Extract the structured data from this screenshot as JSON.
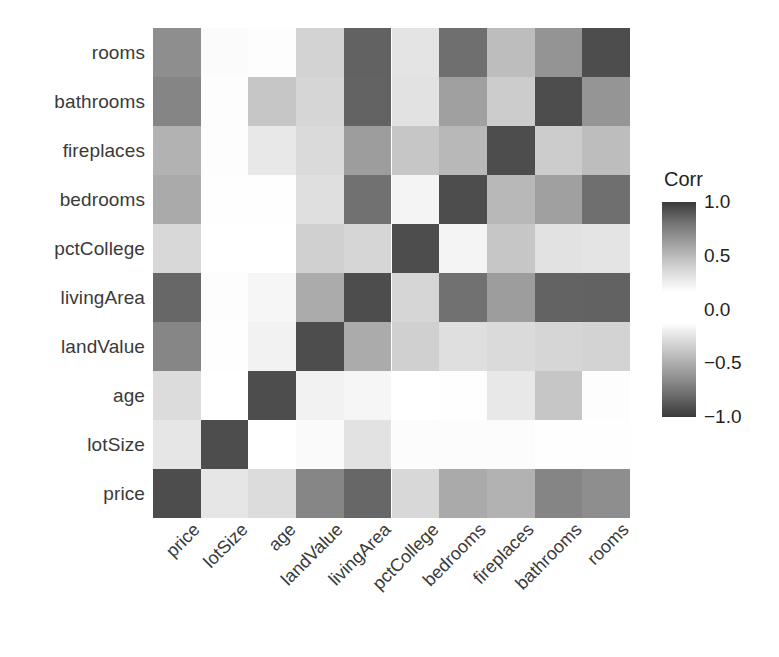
{
  "figure": {
    "type": "correlation-heatmap",
    "background": "#ffffff"
  },
  "legend": {
    "title": "Corr",
    "ticks": [
      {
        "label": "1.0",
        "value": 1.0
      },
      {
        "label": "0.5",
        "value": 0.5
      },
      {
        "label": "0.0",
        "value": 0.0
      },
      {
        "label": "−0.5",
        "value": -0.5
      },
      {
        "label": "−1.0",
        "value": -1.0
      }
    ],
    "high_color": "#3a3a3a",
    "mid_color": "#ffffff",
    "low_color": "#3a3a3a"
  },
  "chart_data": {
    "type": "heatmap",
    "title": "",
    "xlabel": "",
    "ylabel": "",
    "grid": false,
    "legend_position": "right",
    "legend_title": "Corr",
    "zlim": [
      -1.0,
      1.0
    ],
    "x": [
      "price",
      "lotSize",
      "age",
      "landValue",
      "livingArea",
      "pctCollege",
      "bedrooms",
      "fireplaces",
      "bathrooms",
      "rooms"
    ],
    "y": [
      "rooms",
      "bathrooms",
      "fireplaces",
      "bedrooms",
      "pctCollege",
      "livingArea",
      "landValue",
      "age",
      "lotSize",
      "price"
    ],
    "xtick_labels": [
      "price",
      "lotSize",
      "age",
      "landValue",
      "livingArea",
      "pctCollege",
      "bedrooms",
      "fireplaces",
      "bathrooms",
      "rooms"
    ],
    "ytick_labels": [
      "rooms",
      "bathrooms",
      "fireplaces",
      "bedrooms",
      "pctCollege",
      "livingArea",
      "landValue",
      "age",
      "lotSize",
      "price"
    ],
    "values": [
      [
        0.53,
        0.0,
        0.01,
        0.23,
        0.73,
        0.16,
        0.67,
        0.32,
        0.52,
        1.0
      ],
      [
        0.59,
        0.0,
        0.19,
        0.22,
        0.72,
        0.17,
        0.46,
        0.24,
        1.0,
        0.52
      ],
      [
        0.38,
        0.0,
        0.11,
        0.21,
        0.47,
        0.25,
        0.29,
        1.0,
        0.24,
        0.32
      ],
      [
        0.42,
        0.0,
        0.0,
        0.19,
        0.66,
        0.04,
        1.0,
        0.29,
        0.46,
        0.67
      ],
      [
        0.2,
        0.0,
        0.0,
        0.24,
        0.21,
        1.0,
        0.04,
        0.25,
        0.17,
        0.16
      ],
      [
        0.71,
        0.0,
        0.03,
        0.42,
        1.0,
        0.21,
        0.66,
        0.47,
        0.72,
        0.73
      ],
      [
        0.58,
        0.0,
        0.05,
        1.0,
        0.42,
        0.24,
        0.19,
        0.21,
        0.22,
        0.23
      ],
      [
        0.19,
        0.0,
        1.0,
        0.05,
        0.03,
        0.0,
        0.0,
        0.11,
        0.19,
        0.01
      ],
      [
        0.16,
        1.0,
        0.0,
        0.05,
        0.17,
        0.15,
        0.1,
        0.1,
        0.08,
        0.14
      ],
      [
        1.0,
        0.16,
        0.19,
        0.58,
        0.71,
        0.2,
        0.42,
        0.38,
        0.59,
        0.53
      ]
    ]
  },
  "cells": [
    {
      "row": 0,
      "col": 0,
      "color": "#8e8e8e"
    },
    {
      "row": 0,
      "col": 1,
      "color": "#fbfbfb"
    },
    {
      "row": 0,
      "col": 2,
      "color": "#fdfdfd"
    },
    {
      "row": 0,
      "col": 3,
      "color": "#d3d3d3"
    },
    {
      "row": 0,
      "col": 4,
      "color": "#626262"
    },
    {
      "row": 0,
      "col": 5,
      "color": "#e4e4e4"
    },
    {
      "row": 0,
      "col": 6,
      "color": "#6f6f6f"
    },
    {
      "row": 0,
      "col": 7,
      "color": "#bdbdbd"
    },
    {
      "row": 0,
      "col": 8,
      "color": "#949494"
    },
    {
      "row": 0,
      "col": 9,
      "color": "#4d4d4d"
    },
    {
      "row": 1,
      "col": 0,
      "color": "#858585"
    },
    {
      "row": 1,
      "col": 1,
      "color": "#fdfdfd"
    },
    {
      "row": 1,
      "col": 2,
      "color": "#c6c6c6"
    },
    {
      "row": 1,
      "col": 3,
      "color": "#d6d6d6"
    },
    {
      "row": 1,
      "col": 4,
      "color": "#636363"
    },
    {
      "row": 1,
      "col": 5,
      "color": "#e2e2e2"
    },
    {
      "row": 1,
      "col": 6,
      "color": "#a0a0a0"
    },
    {
      "row": 1,
      "col": 7,
      "color": "#cccccc"
    },
    {
      "row": 1,
      "col": 8,
      "color": "#4d4d4d"
    },
    {
      "row": 1,
      "col": 9,
      "color": "#959595"
    },
    {
      "row": 2,
      "col": 0,
      "color": "#b2b2b2"
    },
    {
      "row": 2,
      "col": 1,
      "color": "#fdfdfd"
    },
    {
      "row": 2,
      "col": 2,
      "color": "#e8e8e8"
    },
    {
      "row": 2,
      "col": 3,
      "color": "#dadada"
    },
    {
      "row": 2,
      "col": 4,
      "color": "#9d9d9d"
    },
    {
      "row": 2,
      "col": 5,
      "color": "#c6c6c6"
    },
    {
      "row": 2,
      "col": 6,
      "color": "#b8b8b8"
    },
    {
      "row": 2,
      "col": 7,
      "color": "#4d4d4d"
    },
    {
      "row": 2,
      "col": 8,
      "color": "#cccccc"
    },
    {
      "row": 2,
      "col": 9,
      "color": "#bdbdbd"
    },
    {
      "row": 3,
      "col": 0,
      "color": "#aaaaaa"
    },
    {
      "row": 3,
      "col": 1,
      "color": "#fefefe"
    },
    {
      "row": 3,
      "col": 2,
      "color": "#fefefe"
    },
    {
      "row": 3,
      "col": 3,
      "color": "#dfdfdf"
    },
    {
      "row": 3,
      "col": 4,
      "color": "#717171"
    },
    {
      "row": 3,
      "col": 5,
      "color": "#f4f4f4"
    },
    {
      "row": 3,
      "col": 6,
      "color": "#4d4d4d"
    },
    {
      "row": 3,
      "col": 7,
      "color": "#b8b8b8"
    },
    {
      "row": 3,
      "col": 8,
      "color": "#a0a0a0"
    },
    {
      "row": 3,
      "col": 9,
      "color": "#6f6f6f"
    },
    {
      "row": 4,
      "col": 0,
      "color": "#d8d8d8"
    },
    {
      "row": 4,
      "col": 1,
      "color": "#ffffff"
    },
    {
      "row": 4,
      "col": 2,
      "color": "#ffffff"
    },
    {
      "row": 4,
      "col": 3,
      "color": "#d0d0d0"
    },
    {
      "row": 4,
      "col": 4,
      "color": "#d6d6d6"
    },
    {
      "row": 4,
      "col": 5,
      "color": "#4d4d4d"
    },
    {
      "row": 4,
      "col": 6,
      "color": "#f4f4f4"
    },
    {
      "row": 4,
      "col": 7,
      "color": "#c6c6c6"
    },
    {
      "row": 4,
      "col": 8,
      "color": "#e2e2e2"
    },
    {
      "row": 4,
      "col": 9,
      "color": "#e4e4e4"
    },
    {
      "row": 5,
      "col": 0,
      "color": "#676767"
    },
    {
      "row": 5,
      "col": 1,
      "color": "#fdfdfd"
    },
    {
      "row": 5,
      "col": 2,
      "color": "#f6f6f6"
    },
    {
      "row": 5,
      "col": 3,
      "color": "#ababab"
    },
    {
      "row": 5,
      "col": 4,
      "color": "#4d4d4d"
    },
    {
      "row": 5,
      "col": 5,
      "color": "#d6d6d6"
    },
    {
      "row": 5,
      "col": 6,
      "color": "#717171"
    },
    {
      "row": 5,
      "col": 7,
      "color": "#9d9d9d"
    },
    {
      "row": 5,
      "col": 8,
      "color": "#636363"
    },
    {
      "row": 5,
      "col": 9,
      "color": "#626262"
    },
    {
      "row": 6,
      "col": 0,
      "color": "#868686"
    },
    {
      "row": 6,
      "col": 1,
      "color": "#fefefe"
    },
    {
      "row": 6,
      "col": 2,
      "color": "#f2f2f2"
    },
    {
      "row": 6,
      "col": 3,
      "color": "#4d4d4d"
    },
    {
      "row": 6,
      "col": 4,
      "color": "#ababab"
    },
    {
      "row": 6,
      "col": 5,
      "color": "#d0d0d0"
    },
    {
      "row": 6,
      "col": 6,
      "color": "#dfdfdf"
    },
    {
      "row": 6,
      "col": 7,
      "color": "#dadada"
    },
    {
      "row": 6,
      "col": 8,
      "color": "#d6d6d6"
    },
    {
      "row": 6,
      "col": 9,
      "color": "#d3d3d3"
    },
    {
      "row": 7,
      "col": 0,
      "color": "#dcdcdc"
    },
    {
      "row": 7,
      "col": 1,
      "color": "#ffffff"
    },
    {
      "row": 7,
      "col": 2,
      "color": "#4d4d4d"
    },
    {
      "row": 7,
      "col": 3,
      "color": "#f2f2f2"
    },
    {
      "row": 7,
      "col": 4,
      "color": "#f6f6f6"
    },
    {
      "row": 7,
      "col": 5,
      "color": "#ffffff"
    },
    {
      "row": 7,
      "col": 6,
      "color": "#fefefe"
    },
    {
      "row": 7,
      "col": 7,
      "color": "#e8e8e8"
    },
    {
      "row": 7,
      "col": 8,
      "color": "#c6c6c6"
    },
    {
      "row": 7,
      "col": 9,
      "color": "#fdfdfd"
    },
    {
      "row": 8,
      "col": 0,
      "color": "#e6e6e6"
    },
    {
      "row": 8,
      "col": 1,
      "color": "#4d4d4d"
    },
    {
      "row": 8,
      "col": 2,
      "color": "#ffffff"
    },
    {
      "row": 8,
      "col": 3,
      "color": "#fafafa"
    },
    {
      "row": 8,
      "col": 4,
      "color": "#e2e2e2"
    },
    {
      "row": 8,
      "col": 5,
      "color": "#fcfcfc"
    },
    {
      "row": 8,
      "col": 6,
      "color": "#fcfcfc"
    },
    {
      "row": 8,
      "col": 7,
      "color": "#fcfcfc"
    },
    {
      "row": 8,
      "col": 8,
      "color": "#fefefe"
    },
    {
      "row": 8,
      "col": 9,
      "color": "#fefefe"
    },
    {
      "row": 9,
      "col": 0,
      "color": "#4d4d4d"
    },
    {
      "row": 9,
      "col": 1,
      "color": "#e6e6e6"
    },
    {
      "row": 9,
      "col": 2,
      "color": "#dcdcdc"
    },
    {
      "row": 9,
      "col": 3,
      "color": "#868686"
    },
    {
      "row": 9,
      "col": 4,
      "color": "#676767"
    },
    {
      "row": 9,
      "col": 5,
      "color": "#d8d8d8"
    },
    {
      "row": 9,
      "col": 6,
      "color": "#aaaaaa"
    },
    {
      "row": 9,
      "col": 7,
      "color": "#b2b2b2"
    },
    {
      "row": 9,
      "col": 8,
      "color": "#858585"
    },
    {
      "row": 9,
      "col": 9,
      "color": "#8e8e8e"
    }
  ]
}
